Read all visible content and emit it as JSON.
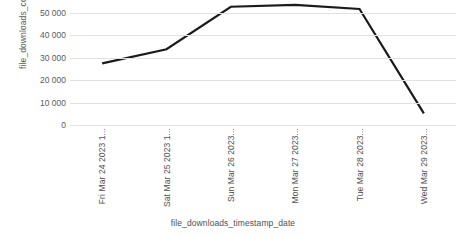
{
  "chart_data": {
    "type": "line",
    "title": "",
    "xlabel": "file_downloads_timestamp_date",
    "ylabel": "file_downloads_count",
    "categories": [
      "Fri Mar 24 2023 1...",
      "Sat Mar 25 2023 1...",
      "Sun Mar 26 2023...",
      "Mon Mar 27 2023...",
      "Tue Mar 28 2023...",
      "Wed Mar 29 2023..."
    ],
    "values": [
      27500,
      33800,
      52800,
      53600,
      51800,
      5200
    ],
    "series": [
      {
        "name": "file_downloads_count",
        "values": [
          27500,
          33800,
          52800,
          53600,
          51800,
          5200
        ]
      }
    ],
    "ylim": [
      0,
      50000
    ],
    "yticks": [
      0,
      10000,
      20000,
      30000,
      40000,
      50000
    ],
    "ytick_labels": [
      "0",
      "10 000",
      "20 000",
      "30 000",
      "40 000",
      "50 000"
    ],
    "grid": true,
    "legend": "none",
    "line_color": "#1a1a1a",
    "grid_color": "#e2e2e2",
    "text_color": "#595959"
  },
  "axes": {
    "y_title": "file_downloads_count",
    "x_title": "file_downloads_timestamp_date"
  }
}
